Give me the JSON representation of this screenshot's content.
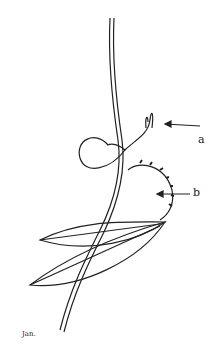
{
  "figure": {
    "labels": {
      "a": "a",
      "b": "b"
    },
    "signature": "Jan."
  }
}
